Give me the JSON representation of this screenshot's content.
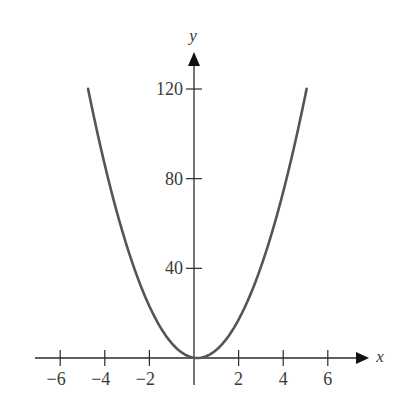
{
  "chart_data": {
    "type": "line",
    "title": "",
    "xlabel": "x",
    "ylabel": "y",
    "equation": "y = 5x^2",
    "xlim": [
      -7,
      7.6
    ],
    "ylim": [
      0,
      136
    ],
    "x_ticks": [
      -6,
      -4,
      -2,
      2,
      4,
      6
    ],
    "x_tick_labels": [
      "−6",
      "−4",
      "−2",
      "2",
      "4",
      "6"
    ],
    "y_ticks": [
      40,
      80,
      120
    ],
    "y_tick_labels": [
      "40",
      "80",
      "120"
    ],
    "grid": false,
    "legend": null,
    "series": [
      {
        "name": "y = 5x^2",
        "color": "#555555",
        "x": [
          -4.9,
          -4,
          -3,
          -2,
          -1,
          0,
          1,
          2,
          3,
          4,
          4.9
        ],
        "y": [
          120,
          80,
          45,
          20,
          5,
          0,
          5,
          20,
          45,
          80,
          120
        ]
      }
    ]
  },
  "colors": {
    "axis": "#2a2a2a",
    "curve": "#555555",
    "text": "#3a3a3a"
  }
}
